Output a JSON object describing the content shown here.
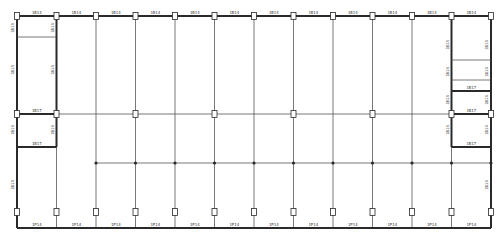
{
  "drawing": {
    "type": "structural framing plan",
    "colors": {
      "line": "#555555",
      "thick": "#2a2a2a",
      "background": "#ffffff"
    },
    "grid_lines_x_count": 13,
    "beam_labels": {
      "primary": "1B14",
      "secondary": "1B17",
      "edge": "1B14"
    },
    "top_beam_labels": [
      "1B14",
      "1B14",
      "1B14",
      "1B14",
      "1B14",
      "1B14",
      "1B14",
      "1B14",
      "1B14",
      "1B14",
      "1B14",
      "1B14"
    ],
    "bottom_beam_labels": [
      "1P14",
      "1P14",
      "1P14",
      "1P14",
      "1P14",
      "1P14",
      "1P14",
      "1P14",
      "1P14",
      "1P14",
      "1P14",
      "1P14"
    ],
    "left_edge_labels": [
      "1B14",
      "1B14",
      "1B14",
      "1B14"
    ],
    "left_inner_labels": [
      "1B14",
      "1B14",
      "1B14"
    ],
    "right_inner_labels": [
      "1B14",
      "1B14",
      "1B14",
      "1B14"
    ],
    "right_edge_labels": [
      "1B14",
      "1B14",
      "1B14",
      "1B14",
      "1B14"
    ],
    "left_bay_beams": [
      "1B17",
      "1B17"
    ],
    "right_bay_beams": [
      "1B17",
      "1B17",
      "1B17"
    ]
  }
}
